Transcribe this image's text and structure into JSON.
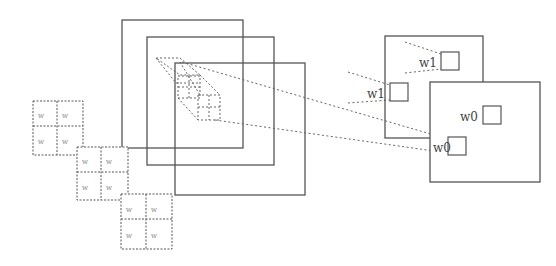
{
  "diagram": {
    "output_labels": [
      "w1",
      "w1",
      "w0",
      "w0"
    ],
    "weight_grids": [
      {
        "cells": [
          "w",
          "w",
          "w",
          "w"
        ]
      },
      {
        "cells": [
          "w",
          "w",
          "w",
          "w"
        ]
      },
      {
        "cells": [
          "w",
          "w",
          "w",
          "w"
        ]
      }
    ],
    "colors": {
      "line": "#555555",
      "dotted": "#666666",
      "text": "#444444"
    }
  }
}
